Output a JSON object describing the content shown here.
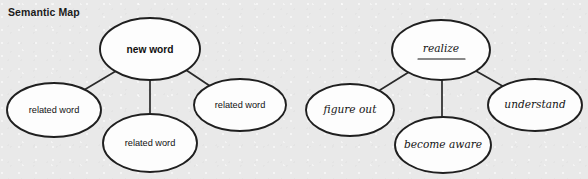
{
  "title": "Semantic Map",
  "background_color": "#e9e9e9",
  "node_fill_color": "#fdfdfd",
  "node_stroke_color": "#1f1f1f",
  "diagrams": [
    {
      "id": "template-map",
      "style": "print",
      "center": {
        "label": "new word",
        "cx": 150,
        "cy": 49,
        "rx": 50,
        "ry": 31
      },
      "branches": [
        {
          "label": "related word",
          "cx": 54,
          "cy": 110,
          "rx": 47,
          "ry": 27
        },
        {
          "label": "related word",
          "cx": 150,
          "cy": 143,
          "rx": 47,
          "ry": 29
        },
        {
          "label": "related word",
          "cx": 240,
          "cy": 105,
          "rx": 46,
          "ry": 26
        }
      ]
    },
    {
      "id": "example-map",
      "style": "handwriting",
      "center": {
        "label": "realize",
        "cx": 441,
        "cy": 50,
        "rx": 49,
        "ry": 30,
        "underline": true
      },
      "branches": [
        {
          "label": "figure out",
          "cx": 350,
          "cy": 110,
          "rx": 44,
          "ry": 26
        },
        {
          "label": "become aware",
          "cx": 443,
          "cy": 145,
          "rx": 48,
          "ry": 28
        },
        {
          "label": "understand",
          "cx": 535,
          "cy": 105,
          "rx": 47,
          "ry": 26
        }
      ]
    }
  ],
  "edges": [
    {
      "x1": 116,
      "y1": 71,
      "x2": 84,
      "y2": 90
    },
    {
      "x1": 150,
      "y1": 80,
      "x2": 150,
      "y2": 114
    },
    {
      "x1": 186,
      "y1": 70,
      "x2": 213,
      "y2": 88
    },
    {
      "x1": 409,
      "y1": 72,
      "x2": 380,
      "y2": 90
    },
    {
      "x1": 442,
      "y1": 80,
      "x2": 442,
      "y2": 117
    },
    {
      "x1": 476,
      "y1": 71,
      "x2": 506,
      "y2": 88
    }
  ]
}
